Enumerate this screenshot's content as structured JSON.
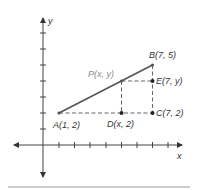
{
  "diagram": {
    "axes": {
      "x_label": "x",
      "y_label": "y"
    },
    "points": {
      "A": {
        "label": "A(1, 2)"
      },
      "B": {
        "label": "B(7, 5)"
      },
      "P": {
        "label": "P(x, y)"
      },
      "D": {
        "label": "D(x, 2)"
      },
      "E": {
        "label": "E(7, y)"
      },
      "C": {
        "label": "C(7, 2)"
      }
    },
    "colors": {
      "line": "#555555",
      "label_p": "#8a8a8a",
      "text": "#333333"
    }
  }
}
